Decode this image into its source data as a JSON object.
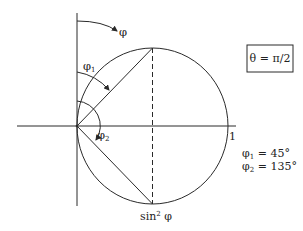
{
  "diagram": {
    "type": "polar-radiation-pattern",
    "colors": {
      "line": "#2a2a2a",
      "text": "#222222",
      "background": "#ffffff"
    },
    "labels": {
      "phi": "φ",
      "phi1": "φ",
      "phi1_sub": "1",
      "phi2": "φ",
      "phi2_sub": "2",
      "unit_mark": "1",
      "sin2phi_base": "sin",
      "sin2phi_sup": "2",
      "sin2phi_var": " φ",
      "theta_box": "θ = π/2",
      "legend": [
        {
          "sym": "φ",
          "sub": "1",
          "value": " = 45°"
        },
        {
          "sym": "φ",
          "sub": "2",
          "value": " = 135°"
        }
      ]
    },
    "geometry": {
      "origin": [
        77,
        126
      ],
      "circle_center": [
        152.5,
        126
      ],
      "circle_rx": 75.5,
      "circle_ry": 78,
      "phi1_deg": 45,
      "phi2_deg": 135
    }
  }
}
